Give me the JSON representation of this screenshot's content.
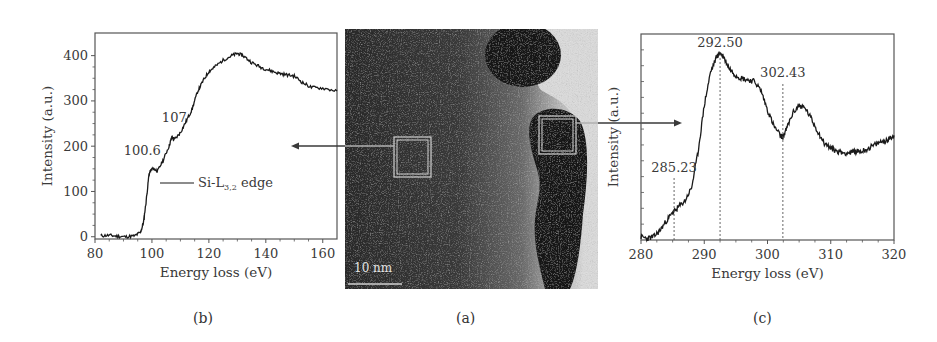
{
  "figure": {
    "panels": [
      {
        "id": "b",
        "caption": "(b)"
      },
      {
        "id": "a",
        "caption": "(a)"
      },
      {
        "id": "c",
        "caption": "(c)"
      }
    ],
    "tem_image": {
      "scale_bar_label": "10 nm",
      "description": "TEM micrograph with two boxed regions linked by arrows to EELS spectra"
    }
  },
  "chart_data": [
    {
      "panel": "b",
      "type": "line",
      "title": "",
      "xlabel": "Energy loss (eV)",
      "ylabel": "Intensity (a.u.)",
      "xlim": [
        80,
        165
      ],
      "ylim": [
        -5,
        450
      ],
      "xticks": [
        80,
        100,
        120,
        140,
        160
      ],
      "yticks": [
        0,
        100,
        200,
        300,
        400
      ],
      "legend": [
        {
          "label": "Si-L3,2 edge",
          "label_main": "Si-L",
          "label_sub": "3,2",
          "label_tail": " edge"
        }
      ],
      "annotations": [
        {
          "text": "100.6",
          "x": 100.6,
          "y": 150
        },
        {
          "text": "107",
          "x": 107,
          "y": 220
        }
      ],
      "series": [
        {
          "name": "Si-L3,2 edge",
          "x": [
            82,
            85,
            88,
            91,
            94,
            96,
            97,
            98,
            99,
            100,
            100.6,
            102,
            104,
            106,
            107,
            108,
            110,
            112,
            114,
            116,
            118,
            120,
            122,
            125,
            128,
            130,
            132,
            135,
            138,
            141,
            144,
            147,
            150,
            153,
            156,
            160,
            165
          ],
          "y": [
            2,
            3,
            1,
            0,
            2,
            10,
            30,
            80,
            140,
            150,
            150,
            145,
            170,
            200,
            220,
            215,
            230,
            255,
            280,
            320,
            345,
            365,
            375,
            390,
            400,
            405,
            400,
            385,
            375,
            368,
            362,
            358,
            355,
            340,
            330,
            328,
            322
          ]
        }
      ]
    },
    {
      "panel": "c",
      "type": "line",
      "title": "",
      "xlabel": "Energy loss (eV)",
      "ylabel": "Intensity (a.u.)",
      "xlim": [
        280,
        320
      ],
      "ylim": [
        0,
        13
      ],
      "xticks": [
        280,
        290,
        300,
        310,
        320
      ],
      "yticks": [],
      "annotations": [
        {
          "text": "285.23",
          "x": 285.23,
          "dashed_line": true
        },
        {
          "text": "292.50",
          "x": 292.5,
          "dashed_line": true
        },
        {
          "text": "302.43",
          "x": 302.43,
          "dashed_line": true
        }
      ],
      "series": [
        {
          "name": "C-K edge",
          "x": [
            280,
            281,
            282,
            283,
            284,
            285,
            285.23,
            286,
            287,
            288,
            289,
            290,
            291,
            292,
            292.5,
            293,
            294,
            295,
            296,
            297,
            298,
            299,
            300,
            301,
            302,
            302.43,
            303,
            304,
            305,
            306,
            307,
            308,
            309,
            310,
            311,
            312,
            313,
            314,
            315,
            316,
            317,
            318,
            319,
            320
          ],
          "y": [
            0.2,
            0.1,
            0.2,
            0.6,
            1.2,
            1.7,
            1.8,
            2.1,
            2.5,
            3.3,
            5.5,
            8.5,
            10.6,
            11.6,
            11.8,
            11.6,
            10.8,
            10.4,
            10.2,
            10.1,
            10.0,
            9.4,
            8.2,
            7.2,
            6.6,
            6.5,
            7.0,
            8.0,
            8.5,
            8.3,
            7.6,
            6.8,
            6.1,
            5.8,
            5.6,
            5.5,
            5.5,
            5.6,
            5.6,
            5.8,
            6.0,
            6.2,
            6.3,
            6.6
          ]
        }
      ]
    }
  ]
}
